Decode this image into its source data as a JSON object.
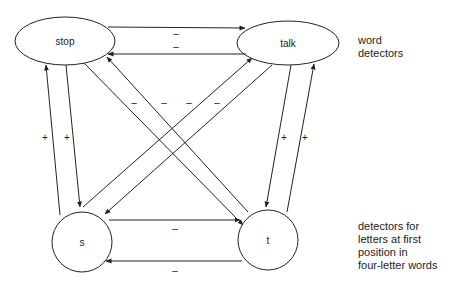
{
  "nodes": {
    "stop": {
      "label": "stop"
    },
    "talk": {
      "label": "talk"
    },
    "s": {
      "label": "s"
    },
    "t": {
      "label": "t"
    }
  },
  "labels": {
    "word_detectors": [
      "word",
      "detectors"
    ],
    "letter_detectors": [
      "detectors for",
      "letters at first",
      "position in",
      "four-letter words"
    ]
  },
  "edges": [
    {
      "from": "stop",
      "to": "talk",
      "sign": "–"
    },
    {
      "from": "talk",
      "to": "stop",
      "sign": "–"
    },
    {
      "from": "s",
      "to": "t",
      "sign": "–"
    },
    {
      "from": "t",
      "to": "s",
      "sign": "–"
    },
    {
      "from": "s",
      "to": "stop",
      "sign": "+"
    },
    {
      "from": "stop",
      "to": "s",
      "sign": "+"
    },
    {
      "from": "talk",
      "to": "t",
      "sign": "+"
    },
    {
      "from": "t",
      "to": "talk",
      "sign": "+"
    },
    {
      "from": "stop",
      "to": "t",
      "sign": "–"
    },
    {
      "from": "t",
      "to": "stop",
      "sign": "–"
    },
    {
      "from": "s",
      "to": "talk",
      "sign": "–"
    },
    {
      "from": "talk",
      "to": "s",
      "sign": "–"
    }
  ]
}
